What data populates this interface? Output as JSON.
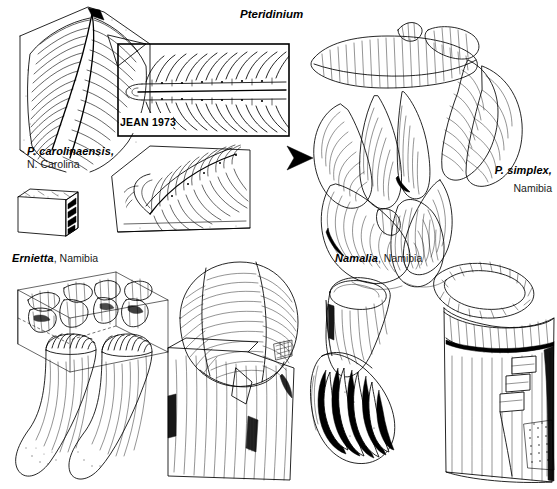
{
  "figure": {
    "kind": "scientific-illustration",
    "background_color": "#ffffff",
    "ink_color": "#000000"
  },
  "panels": {
    "top_left": {
      "name": "pteridinium-carolinaensis-panel",
      "title": "Pteridinium",
      "specimen_label": "P. carolinaensis,",
      "locality_label": "N. Carolina",
      "inset": {
        "caption": "JEAN 1973",
        "box": {
          "x": 117,
          "y": 43,
          "w": 173,
          "h": 94
        }
      }
    },
    "top_right": {
      "name": "pteridinium-simplex-panel",
      "specimen_label": "P. simplex,",
      "locality_label": "Namibia"
    },
    "bottom_left": {
      "name": "ernietta-panel",
      "specimen_label": "Ernietta",
      "locality_label": ", Namibia"
    },
    "bottom_right": {
      "name": "namalia-panel",
      "specimen_label": "Namalia",
      "locality_label": ", Namibia"
    }
  },
  "connectors": {
    "arrow": {
      "name": "transition-arrow",
      "direction": "right",
      "color": "#000000"
    },
    "leader": {
      "name": "inset-leader-triangle",
      "from": "fossil-slab",
      "to": "jean-1973-inset"
    }
  }
}
